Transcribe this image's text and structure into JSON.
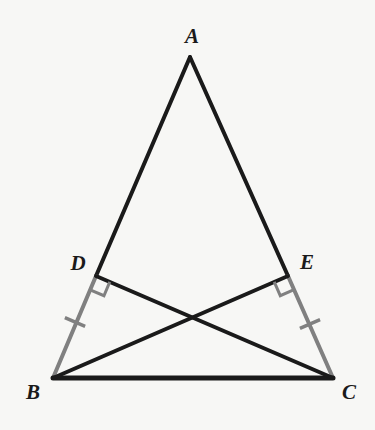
{
  "figure": {
    "background_color": "#f7f7f5",
    "stroke_black": "#1a1a1a",
    "stroke_gray": "#808080",
    "label_color": "#1a1a1a",
    "width": 375,
    "height": 430
  },
  "points": {
    "A": {
      "name": "A",
      "x": 190,
      "y": 57,
      "label_x": 192,
      "label_y": 38
    },
    "B": {
      "name": "B",
      "x": 53,
      "y": 378,
      "label_x": 33,
      "label_y": 394
    },
    "C": {
      "name": "C",
      "x": 333,
      "y": 378,
      "label_x": 349,
      "label_y": 394
    },
    "D": {
      "name": "D",
      "x": 96,
      "y": 276,
      "label_x": 78,
      "label_y": 265
    },
    "E": {
      "name": "E",
      "x": 288,
      "y": 276,
      "label_x": 307,
      "label_y": 264
    },
    "X": {
      "name": "",
      "x": 190,
      "y": 317
    }
  },
  "segments": [
    {
      "id": "AD",
      "from": "A",
      "to": "D",
      "color": "#1a1a1a",
      "width": 4
    },
    {
      "id": "AE",
      "from": "A",
      "to": "E",
      "color": "#1a1a1a",
      "width": 4
    },
    {
      "id": "DB",
      "from": "D",
      "to": "B",
      "color": "#808080",
      "width": 4
    },
    {
      "id": "EC",
      "from": "E",
      "to": "C",
      "color": "#808080",
      "width": 4
    },
    {
      "id": "BC",
      "from": "B",
      "to": "C",
      "color": "#1a1a1a",
      "width": 5
    },
    {
      "id": "BE",
      "from": "B",
      "to": "E",
      "color": "#1a1a1a",
      "width": 4
    },
    {
      "id": "CD",
      "from": "C",
      "to": "D",
      "color": "#1a1a1a",
      "width": 4
    }
  ],
  "right_angles": [
    {
      "id": "angle-at-D",
      "at": "D",
      "color": "#808080",
      "size": 15
    },
    {
      "id": "angle-at-E",
      "at": "E",
      "color": "#808080",
      "size": 15
    }
  ],
  "tick_marks": [
    {
      "id": "tick-DB",
      "on": "DB",
      "x": 75,
      "y": 322,
      "color": "#808080",
      "count": 1
    },
    {
      "id": "tick-EC",
      "on": "EC",
      "x": 310,
      "y": 324,
      "color": "#808080",
      "count": 1
    }
  ],
  "labels": {
    "A": "A",
    "B": "B",
    "C": "C",
    "D": "D",
    "E": "E"
  }
}
